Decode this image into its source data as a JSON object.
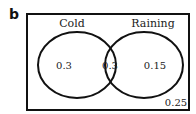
{
  "figure_label": "b",
  "venn": {
    "sets": [
      {
        "name": "Cold",
        "only_value": "0.3"
      },
      {
        "name": "Raining",
        "only_value": "0.15"
      }
    ],
    "intersection_value": "0.3",
    "outside_value": "0.25"
  },
  "colors": {
    "stroke": "#111111",
    "background": "#ffffff"
  }
}
